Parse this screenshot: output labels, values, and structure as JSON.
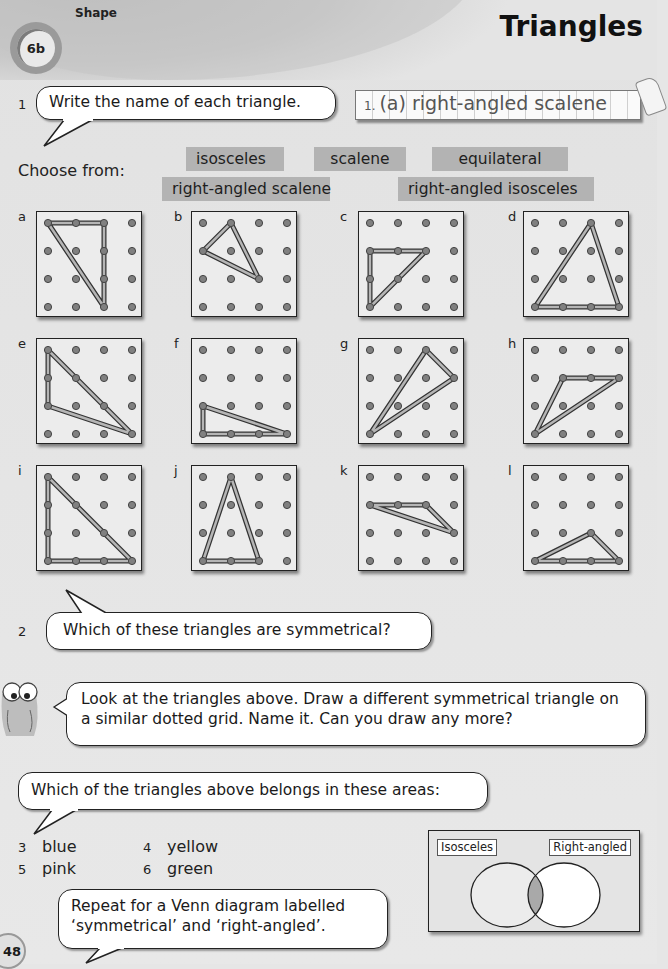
{
  "header": {
    "unit_badge": "6b",
    "unit_label": "Shape",
    "title": "Triangles"
  },
  "question1": {
    "number": "1",
    "prompt": "Write the name of each triangle.",
    "example_answer_number": "1.",
    "example_answer": "(a) right-angled scalene",
    "choose_from_label": "Choose from:",
    "choices": [
      "isosceles",
      "scalene",
      "equilateral",
      "right-angled scalene",
      "right-angled isosceles"
    ]
  },
  "grids": [
    {
      "label": "a",
      "triangle": [
        [
          0,
          0
        ],
        [
          2,
          0
        ],
        [
          2,
          3
        ]
      ]
    },
    {
      "label": "b",
      "triangle": [
        [
          1,
          0
        ],
        [
          0,
          1
        ],
        [
          2,
          2
        ]
      ]
    },
    {
      "label": "c",
      "triangle": [
        [
          0,
          1
        ],
        [
          2,
          1
        ],
        [
          0,
          3
        ]
      ]
    },
    {
      "label": "d",
      "triangle": [
        [
          2,
          0
        ],
        [
          0,
          3
        ],
        [
          3,
          3
        ]
      ]
    },
    {
      "label": "e",
      "triangle": [
        [
          0,
          0
        ],
        [
          0,
          2
        ],
        [
          3,
          3
        ]
      ]
    },
    {
      "label": "f",
      "triangle": [
        [
          0,
          2
        ],
        [
          0,
          3
        ],
        [
          3,
          3
        ]
      ]
    },
    {
      "label": "g",
      "triangle": [
        [
          2,
          0
        ],
        [
          3,
          1
        ],
        [
          0,
          3
        ]
      ]
    },
    {
      "label": "h",
      "triangle": [
        [
          1,
          1
        ],
        [
          3,
          1
        ],
        [
          0,
          3
        ]
      ]
    },
    {
      "label": "i",
      "triangle": [
        [
          0,
          0
        ],
        [
          0,
          3
        ],
        [
          3,
          3
        ]
      ]
    },
    {
      "label": "j",
      "triangle": [
        [
          1,
          0
        ],
        [
          0,
          3
        ],
        [
          2,
          3
        ]
      ]
    },
    {
      "label": "k",
      "triangle": [
        [
          0,
          1
        ],
        [
          2,
          1
        ],
        [
          3,
          2
        ]
      ]
    },
    {
      "label": "l",
      "triangle": [
        [
          2,
          2
        ],
        [
          0,
          3
        ],
        [
          3,
          3
        ]
      ]
    }
  ],
  "question2": {
    "number": "2",
    "prompt": "Which of these triangles are symmetrical?"
  },
  "owl_tip": {
    "text": "Look at the triangles above. Draw a different symmetrical triangle on a similar dotted grid. Name it. Can you draw any more?"
  },
  "venn_question": {
    "prompt": "Which of the triangles above belongs in these areas:",
    "items": [
      {
        "number": "3",
        "label": "blue"
      },
      {
        "number": "4",
        "label": "yellow"
      },
      {
        "number": "5",
        "label": "pink"
      },
      {
        "number": "6",
        "label": "green"
      }
    ],
    "venn": {
      "left_label": "Isosceles",
      "right_label": "Right-angled",
      "left_fill": "#ececec",
      "right_fill": "#ffffff",
      "overlap_fill": "#a9a9a9"
    },
    "followup": "Repeat for a Venn diagram labelled ‘symmetrical’ and ‘right-angled’."
  },
  "footer": {
    "page_number": "48"
  }
}
